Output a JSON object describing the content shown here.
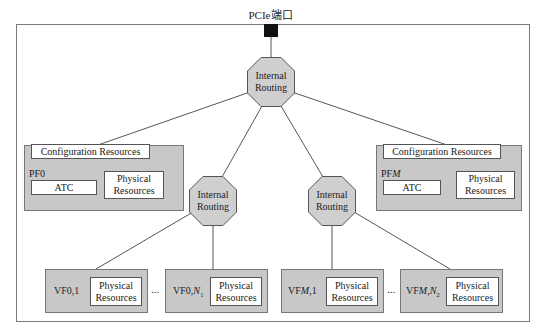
{
  "port": {
    "label": "PCIe端口"
  },
  "routers": [
    {
      "label_line1": "Internal",
      "label_line2": "Routing"
    },
    {
      "label_line1": "Internal",
      "label_line2": "Routing"
    },
    {
      "label_line1": "Internal",
      "label_line2": "Routing"
    }
  ],
  "pfs": [
    {
      "name": "PF0",
      "config": "Configuration Resources",
      "atc": "ATC",
      "phys_line1": "Physical",
      "phys_line2": "Resources"
    },
    {
      "name": "PFM",
      "config": "Configuration Resources",
      "atc": "ATC",
      "phys_line1": "Physical",
      "phys_line2": "Resources"
    }
  ],
  "vfs": [
    {
      "name": "VF0,1",
      "phys_line1": "Physical",
      "phys_line2": "Resources"
    },
    {
      "name": "VF0,N1",
      "phys_line1": "Physical",
      "phys_line2": "Resources"
    },
    {
      "name": "VFM,1",
      "phys_line1": "Physical",
      "phys_line2": "Resources"
    },
    {
      "name": "VFM,N2",
      "phys_line1": "Physical",
      "phys_line2": "Resources"
    }
  ],
  "ellipsis": "...",
  "colors": {
    "box_fill": "#c8c8c8",
    "router_fill": "#cfcfcf",
    "line": "#555555",
    "port": "#111111"
  }
}
